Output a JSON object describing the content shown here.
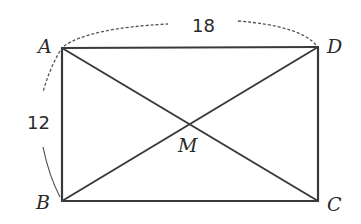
{
  "figure": {
    "type": "rectangle-with-diagonals",
    "vertices": {
      "A": {
        "label": "A",
        "x": 62,
        "y": 48
      },
      "B": {
        "label": "B",
        "x": 62,
        "y": 201
      },
      "C": {
        "label": "C",
        "x": 318,
        "y": 201
      },
      "D": {
        "label": "D",
        "x": 318,
        "y": 47
      }
    },
    "intersection": {
      "label": "M",
      "x": 190,
      "y": 124
    },
    "dimensions": {
      "top_length": "18",
      "left_length": "12"
    },
    "colors": {
      "line": "#3a3a3a",
      "arc": "#555555",
      "text": "#2a2a2a",
      "background": "#ffffff"
    }
  }
}
